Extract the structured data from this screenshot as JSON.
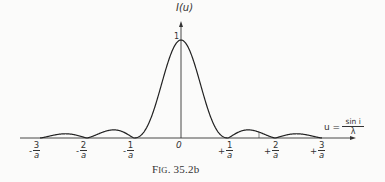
{
  "chart_data": {
    "type": "line",
    "title": "",
    "caption": "FIG. 35.2b",
    "xlabel": "u = sin i / λ",
    "ylabel": "I(u)",
    "x_ticks": [
      "-3/a",
      "-2/a",
      "-1/a",
      "0",
      "+1/a",
      "+2/a",
      "+3/a"
    ],
    "y_ticks": [
      "1"
    ],
    "ylim": [
      0,
      1
    ],
    "xlim_in_units_of_1_over_a": [
      -3,
      3
    ],
    "grid": false,
    "series": [
      {
        "name": "I(u) (sinc² diffraction pattern)",
        "x": [
          -3,
          -2.5,
          -2,
          -1.5,
          -1,
          -0.5,
          0,
          0.5,
          1,
          1.5,
          2,
          2.5,
          3
        ],
        "values": [
          0,
          0.016,
          0,
          0.045,
          0,
          0.405,
          1,
          0.405,
          0,
          0.045,
          0,
          0.016,
          0
        ]
      }
    ]
  },
  "labels": {
    "y_axis": "I(u)",
    "y_peak": "1",
    "origin": "0",
    "x_axis_var": "u =",
    "x_axis_num": "sin  i",
    "x_axis_den": "λ",
    "caption_main": "F",
    "caption_sc": "IG",
    "caption_rest": ". 35.2b",
    "ticks": [
      {
        "sign": "-",
        "num": "3",
        "den": "a"
      },
      {
        "sign": "-",
        "num": "2",
        "den": "a"
      },
      {
        "sign": "-",
        "num": "1",
        "den": "a"
      },
      {
        "sign": "+",
        "num": "1",
        "den": "a"
      },
      {
        "sign": "+",
        "num": "2",
        "den": "a"
      },
      {
        "sign": "+",
        "num": "3",
        "den": "a"
      }
    ]
  }
}
